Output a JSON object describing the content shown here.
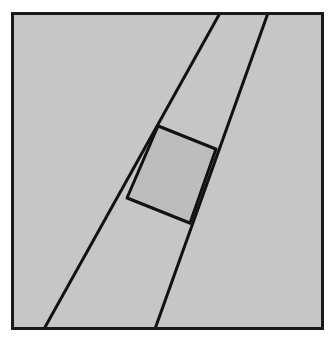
{
  "figure": {
    "kind": "geometry-diagram",
    "page_background": "#ffffff",
    "canvas": {
      "width": 334,
      "height": 340
    },
    "frame": {
      "name": "figure-frame",
      "x": 11,
      "y": 12,
      "width": 313,
      "height": 318,
      "fill": "#c6c6c6",
      "stroke": "#1a1a1a",
      "stroke_width": 3
    },
    "shaded_quadrilateral": {
      "name": "shaded-quadrilateral",
      "label": "",
      "fill": "#bdbdbd",
      "stroke": "#111111",
      "stroke_width": 3,
      "vertices": [
        {
          "name": "top-left-vertex",
          "x": 158,
          "y": 126
        },
        {
          "name": "top-right-vertex",
          "x": 216,
          "y": 149
        },
        {
          "name": "bottom-right-vertex",
          "x": 190,
          "y": 223
        },
        {
          "name": "bottom-left-vertex",
          "x": 127,
          "y": 198
        }
      ]
    },
    "lines": [
      {
        "name": "left-transversal-line",
        "stroke": "#111111",
        "stroke_width": 3,
        "x1": 220,
        "y1": 13,
        "x2": 44,
        "y2": 329
      },
      {
        "name": "right-transversal-line",
        "stroke": "#111111",
        "stroke_width": 3,
        "x1": 268,
        "y1": 13,
        "x2": 155,
        "y2": 329
      },
      {
        "name": "upper-cross-segment",
        "stroke": "#111111",
        "stroke_width": 3,
        "x1": 158,
        "y1": 126,
        "x2": 216,
        "y2": 149
      },
      {
        "name": "lower-cross-segment",
        "stroke": "#111111",
        "stroke_width": 3,
        "x1": 127,
        "y1": 198,
        "x2": 190,
        "y2": 223
      }
    ],
    "colors": {
      "frame_fill": "#c6c6c6",
      "quad_fill": "#bdbdbd",
      "ink": "#111111",
      "frame_border": "#1a1a1a",
      "page": "#ffffff"
    }
  }
}
